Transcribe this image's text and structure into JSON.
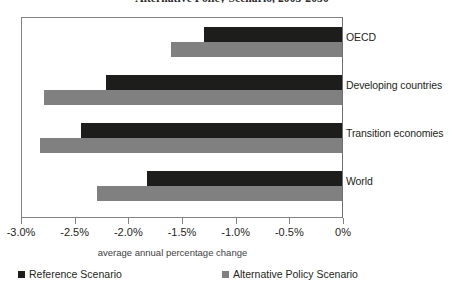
{
  "chart_data": {
    "type": "bar",
    "orientation": "horizontal",
    "title": "Alternative Policy Scenario, 2003-2030",
    "xlabel": "average annual percentage change",
    "ylabel": "",
    "categories": [
      "OECD",
      "Developing countries",
      "Transition economies",
      "World"
    ],
    "series": [
      {
        "name": "Reference Scenario",
        "color": "#1d1d1b",
        "values": [
          -1.29,
          -2.2,
          -2.43,
          -1.82
        ]
      },
      {
        "name": "Alternative Policy Scenario",
        "color": "#808080",
        "values": [
          -1.59,
          -2.78,
          -2.81,
          -2.28
        ]
      }
    ],
    "xlim": [
      -3.0,
      0.0
    ],
    "xticks": [
      -3.0,
      -2.5,
      -2.0,
      -1.5,
      -1.0,
      -0.5,
      0
    ],
    "xtick_labels": [
      "-3.0%",
      "-2.5%",
      "-2.0%",
      "-1.5%",
      "-1.0%",
      "-0.5%",
      "0%"
    ],
    "grid": false,
    "legend_position": "bottom"
  },
  "legend": {
    "items": [
      {
        "label": "Reference Scenario",
        "color": "#1d1d1b"
      },
      {
        "label": "Alternative Policy Scenario",
        "color": "#808080"
      }
    ]
  }
}
